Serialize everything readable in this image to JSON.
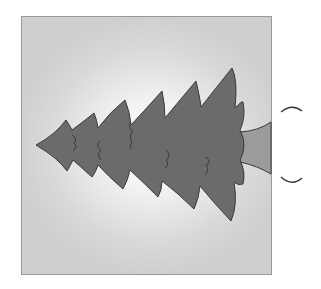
{
  "figure": {
    "colors": {
      "background": "#ffffff",
      "frame_border": "#9a9a9a",
      "frame_center": "#ffffff",
      "frame_edge": "#cfcfcf",
      "tree_fill": "#6b6b6b",
      "tree_outline": "#3a3a3a",
      "trunk_fill": "#9c9c9c",
      "bracket_stroke": "#333333"
    },
    "bracket": {
      "glyph": "( )",
      "orientation": "rotated"
    }
  }
}
